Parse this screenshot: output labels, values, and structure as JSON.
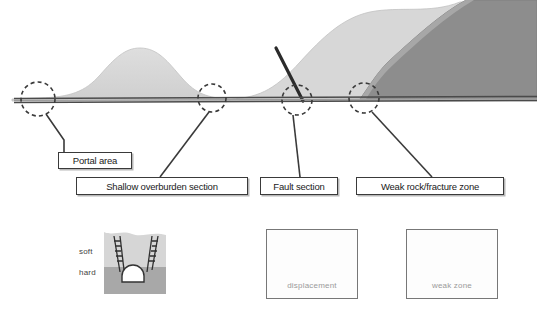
{
  "diagram": {
    "type": "geological-tunnel-profile",
    "colors": {
      "hill_light": "#d9d9d9",
      "hill_mid": "#c9c9c9",
      "rock_dark": "#8a8a8a",
      "tunnel_line": "#4a4a4a",
      "fault_line": "#2b2b2b",
      "callout_circle": "#3a3a3a",
      "leader_line": "#3a3a3a",
      "box_border": "#3a3a3a",
      "box_fill": "#ffffff",
      "caption_text": "#9a9a9a"
    },
    "callouts": [
      {
        "id": "portal-area",
        "label": "Portal area",
        "circle_x": 38,
        "circle_y": 98
      },
      {
        "id": "shallow-overburden",
        "label": "Shallow overburden section",
        "circle_x": 212,
        "circle_y": 97
      },
      {
        "id": "fault-section",
        "label": "Fault section",
        "circle_x": 297,
        "circle_y": 99
      },
      {
        "id": "weak-rock-fracture",
        "label": "Weak rock/fracture zone",
        "circle_x": 364,
        "circle_y": 97
      }
    ],
    "strata_labels": {
      "soft": "soft",
      "hard": "hard"
    },
    "panels": [
      {
        "id": "soft-hard",
        "caption": ""
      },
      {
        "id": "displacement",
        "caption": "displacement"
      },
      {
        "id": "weak-zone",
        "caption": "weak zone"
      }
    ]
  }
}
